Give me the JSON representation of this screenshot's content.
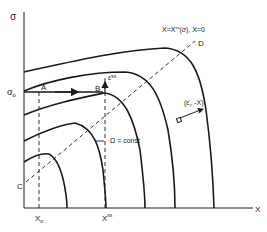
{
  "axes": {
    "y_label": "σ",
    "x_label": "X",
    "y_tick_label": "σ",
    "y_tick_sub": "o",
    "x_tick_1": "X",
    "x_tick_1_sub": "o",
    "x_tick_2": "X",
    "x_tick_2_sup": "ss"
  },
  "points": {
    "A": "A",
    "B": "B",
    "C": "C",
    "D": "D"
  },
  "annotations": {
    "steady_state_curve": "X=X",
    "steady_state_sup": "ss",
    "steady_state_rest": "(σ), Ẋ=0",
    "strain_rate": "ε̇",
    "strain_rate_sup": "ss",
    "omega": "Ω = const",
    "normal_vector": "(ε̇",
    "normal_vector_sup": "i",
    "normal_vector_rest": ", -Ẋ)"
  },
  "colors": {
    "line": "#1a1a1a",
    "background": "#ffffff"
  }
}
